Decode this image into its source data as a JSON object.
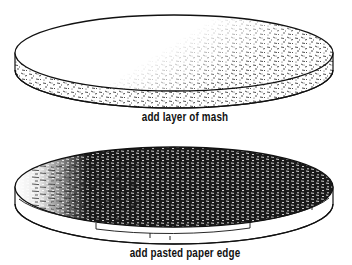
{
  "figure": {
    "panels": [
      {
        "caption": "add layer of mash",
        "depicts": "disc with textured mash layer"
      },
      {
        "caption": "add pasted paper edge",
        "depicts": "dark textured disc with layered pasted paper strips around edge"
      }
    ]
  },
  "colors": {
    "ink": "#111111",
    "background": "#ffffff"
  }
}
